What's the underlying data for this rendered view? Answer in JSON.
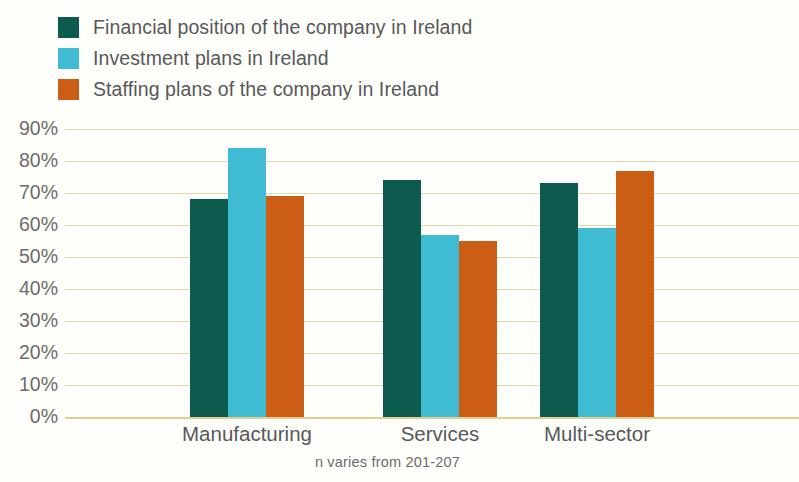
{
  "chart_data": {
    "type": "bar",
    "title": "",
    "subtitle": "",
    "xlabel": "",
    "ylabel": "",
    "categories": [
      "Manufacturing",
      "Services",
      "Multi-sector"
    ],
    "series": [
      {
        "name": "Financial position of the company in Ireland",
        "color": "#0d5a4e",
        "values": [
          68,
          74,
          73
        ],
        "value_labels": [
          "68%",
          "74%",
          "73%"
        ]
      },
      {
        "name": "Investment plans in Ireland",
        "color": "#3fbcd4",
        "values": [
          84,
          57,
          59
        ],
        "value_labels": [
          "84%",
          "57%",
          "59%"
        ]
      },
      {
        "name": "Staffing plans of the company in Ireland",
        "color": "#cc5d14",
        "values": [
          69,
          55,
          77
        ],
        "value_labels": [
          "69%",
          "55%",
          "77%"
        ]
      }
    ],
    "ylim": [
      0,
      90
    ],
    "ytick_values": [
      90,
      80,
      70,
      60,
      50,
      40,
      30,
      20,
      10,
      0
    ],
    "ytick_labels": [
      "90%",
      "80%",
      "70%",
      "60%",
      "50%",
      "40%",
      "30%",
      "20%",
      "10%",
      "0%"
    ],
    "grid": true,
    "grid_color": "#e3d9a8",
    "legend_position": "top-left",
    "footnote": "n varies from 201-207",
    "background_color": "#fefefb",
    "axis_label_color": "#6c6c6e"
  }
}
